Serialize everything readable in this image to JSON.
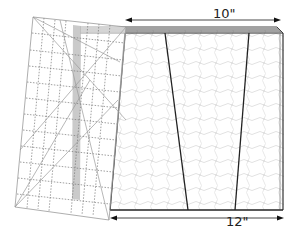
{
  "diagram": {
    "type": "quilting-cut-diagram",
    "top_measurement": {
      "label": "10\""
    },
    "bottom_measurement": {
      "label": "12\""
    },
    "fabric": {
      "description": "stacked fabric layers with quilted texture",
      "cut_lines": 2
    },
    "ruler": {
      "description": "clear quilting ruler placed at an angle over left edge"
    },
    "colors": {
      "line": "#222222",
      "ruler_grid": "#888888",
      "ruler_strip": "#b8b8b8",
      "fabric_texture": "#e4e4e4"
    }
  }
}
